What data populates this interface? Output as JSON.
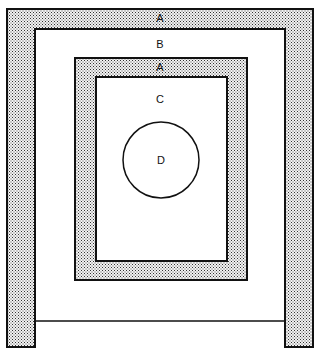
{
  "diagram": {
    "type": "nested-regions",
    "colors": {
      "stroke": "#111111",
      "fill_white": "#ffffff",
      "stipple_dot": "#222222",
      "stipple_bg": "#f2f2f2"
    },
    "regions": {
      "outer_a": {
        "label": "A",
        "x": 7,
        "y": 9,
        "w": 306,
        "h": 338,
        "band": 28,
        "shaded": true
      },
      "b": {
        "label": "B",
        "x": 35,
        "y": 29,
        "w": 250,
        "h": 292,
        "shaded": false
      },
      "inner_a": {
        "label": "A",
        "x": 75,
        "y": 58,
        "w": 172,
        "h": 222,
        "shaded": true
      },
      "c": {
        "label": "C",
        "x": 96,
        "y": 77,
        "w": 131,
        "h": 184,
        "shaded": false
      },
      "d": {
        "label": "D",
        "cx": 161,
        "cy": 160,
        "r": 38,
        "shape": "circle"
      }
    },
    "labels": [
      {
        "text": "A",
        "x": 160,
        "y": 22
      },
      {
        "text": "B",
        "x": 160,
        "y": 48
      },
      {
        "text": "A",
        "x": 160,
        "y": 71
      },
      {
        "text": "C",
        "x": 160,
        "y": 103
      },
      {
        "text": "D",
        "x": 161,
        "y": 164
      }
    ]
  }
}
